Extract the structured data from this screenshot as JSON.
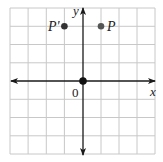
{
  "diagram": {
    "type": "coordinate-plane",
    "grid": {
      "cols": 8,
      "rows": 8,
      "x_min": -4,
      "x_max": 4,
      "y_min": -4,
      "y_max": 4,
      "line_color": "#c8c8c8"
    },
    "axes": {
      "x_label": "x",
      "y_label": "y",
      "origin_label": "0",
      "color": "#1a1a1a"
    },
    "points": [
      {
        "name": "P",
        "label": "P",
        "x": 1,
        "y": 3,
        "color": "#555555"
      },
      {
        "name": "P-prime",
        "label": "P'",
        "x": -1,
        "y": 3,
        "color": "#333333"
      },
      {
        "name": "origin",
        "label": "",
        "x": 0,
        "y": 0,
        "color": "#111111"
      }
    ]
  }
}
